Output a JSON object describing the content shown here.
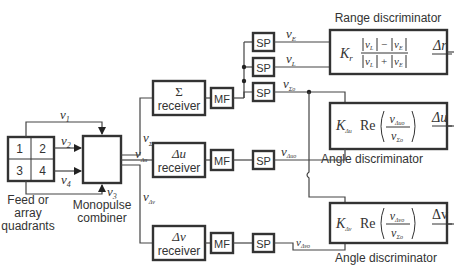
{
  "diagram": {
    "feed": {
      "quadrants": [
        "1",
        "2",
        "3",
        "4"
      ],
      "label_lines": [
        "Feed or",
        "array",
        "quadrants"
      ]
    },
    "combiner": {
      "label_lines": [
        "Monopulse",
        "combiner"
      ]
    },
    "inputs": {
      "v1": {
        "main": "v",
        "sub": "1"
      },
      "v2": {
        "main": "v",
        "sub": "2"
      },
      "v3": {
        "main": "v",
        "sub": "3"
      },
      "v4": {
        "main": "v",
        "sub": "4"
      }
    },
    "outputs": {
      "v_sigma": {
        "main": "v",
        "sub": "Σ"
      },
      "v_du": {
        "main": "v",
        "sub": "Δu"
      },
      "v_dv": {
        "main": "v",
        "sub": "Δv"
      }
    },
    "receivers": {
      "sigma": {
        "symbol": "Σ",
        "label": "receiver"
      },
      "du": {
        "symbol": "Δu",
        "label": "receiver"
      },
      "dv": {
        "symbol": "Δv",
        "label": "receiver"
      }
    },
    "mf_label": "MF",
    "sp_label": "SP",
    "signals": {
      "vE": {
        "main": "v",
        "sub": "E"
      },
      "vL": {
        "main": "v",
        "sub": "L"
      },
      "vSo": {
        "main": "v",
        "sub": "Σo"
      },
      "vduo": {
        "main": "v",
        "sub": "Δuo"
      },
      "vdvo": {
        "main": "v",
        "sub": "Δvo"
      }
    },
    "range_discriminator": {
      "title": "Range discriminator",
      "gain": "K",
      "gain_sub": "r",
      "num_left": "v",
      "num_left_sub": "L",
      "num_op": "−",
      "num_right": "v",
      "num_right_sub": "E",
      "den_left": "v",
      "den_left_sub": "L",
      "den_op": "+",
      "den_right": "v",
      "den_right_sub": "E",
      "output": "Δr"
    },
    "angle_discriminator_u": {
      "title": "Angle discriminator",
      "gain": "K",
      "gain_sub": "Δu",
      "re": "Re",
      "num": "v",
      "num_sub": "Δuo",
      "den": "v",
      "den_sub": "Σo",
      "output": "Δu"
    },
    "angle_discriminator_v": {
      "title": "Angle discriminator",
      "gain": "K",
      "gain_sub": "Δv",
      "re": "Re",
      "num": "v",
      "num_sub": "Δvo",
      "den": "v",
      "den_sub": "Σo",
      "output": "Δv"
    }
  }
}
